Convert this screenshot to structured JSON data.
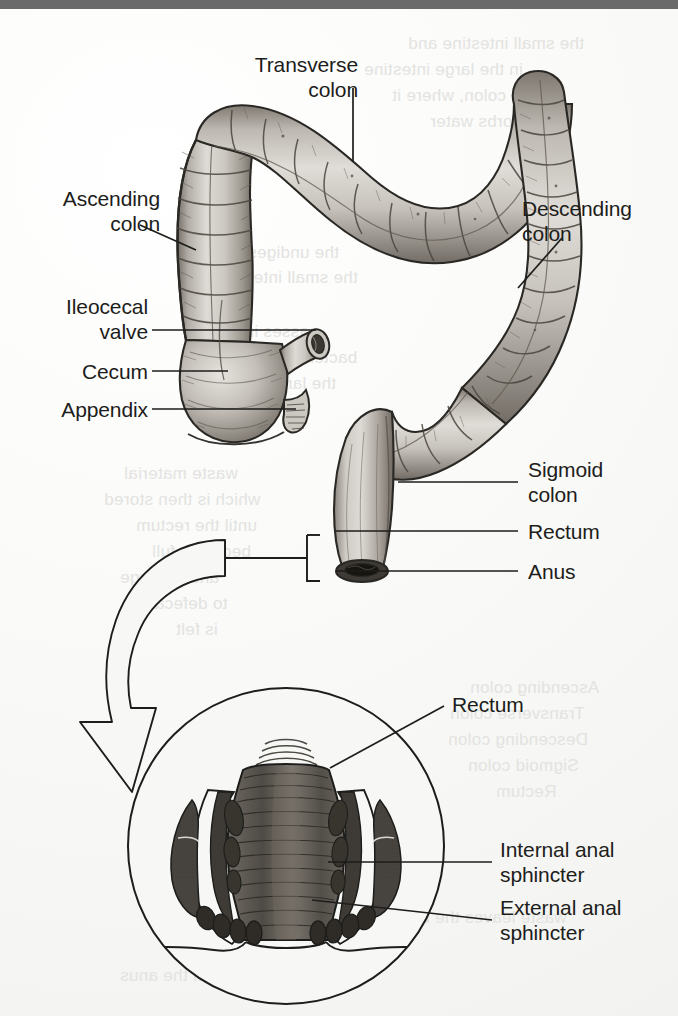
{
  "figure": {
    "style": "grayscale pen-and-ink medical illustration on book page"
  },
  "colors": {
    "page_background": "#f4f4f2",
    "top_bar": "#6a6a6a",
    "ink": "#1d1d1b",
    "tissue_light": "#d8d5d0",
    "tissue_mid": "#a9a49d",
    "tissue_dark": "#6e6a64",
    "muscle_dark": "#4a4743",
    "showthrough_text": "#e3e3e1"
  },
  "main_diagram": {
    "labels": [
      {
        "id": "transverse-colon",
        "text": "Transverse\ncolon",
        "align": "center"
      },
      {
        "id": "ascending-colon",
        "text": "Ascending\ncolon",
        "align": "right"
      },
      {
        "id": "descending-colon",
        "text": "Descending\ncolon",
        "align": "left"
      },
      {
        "id": "ileocecal-valve",
        "text": "Ileocecal\nvalve",
        "align": "right"
      },
      {
        "id": "cecum",
        "text": "Cecum",
        "align": "right"
      },
      {
        "id": "appendix",
        "text": "Appendix",
        "align": "right"
      },
      {
        "id": "sigmoid-colon",
        "text": "Sigmoid\ncolon",
        "align": "left"
      },
      {
        "id": "rectum",
        "text": "Rectum",
        "align": "left"
      },
      {
        "id": "anus",
        "text": "Anus",
        "align": "left"
      }
    ]
  },
  "inset_diagram": {
    "title": "Anal canal cross-section",
    "labels": [
      {
        "id": "inset-rectum",
        "text": "Rectum",
        "align": "left"
      },
      {
        "id": "internal-anal-sphincter",
        "text": "Internal anal\nsphincter",
        "align": "left"
      },
      {
        "id": "external-anal-sphincter",
        "text": "External anal\nsphincter",
        "align": "left"
      }
    ]
  },
  "showthrough_lines": [
    {
      "text": "the small intestine and",
      "x": 408,
      "y": 34
    },
    {
      "text": "in the large intestine",
      "x": 364,
      "y": 60
    },
    {
      "text": "the colon, where it",
      "x": 392,
      "y": 86
    },
    {
      "text": "absorbs water",
      "x": 430,
      "y": 112
    },
    {
      "text": "the undigested food",
      "x": 184,
      "y": 243
    },
    {
      "text": "the small intestine",
      "x": 216,
      "y": 268
    },
    {
      "text": "passes into the",
      "x": 200,
      "y": 322
    },
    {
      "text": "bacterial action",
      "x": 238,
      "y": 348
    },
    {
      "text": "the large intestine",
      "x": 196,
      "y": 374
    },
    {
      "text": "waste material",
      "x": 124,
      "y": 464
    },
    {
      "text": "which is then stored",
      "x": 104,
      "y": 490
    },
    {
      "text": "until the rectum",
      "x": 136,
      "y": 516
    },
    {
      "text": "becomes full",
      "x": 152,
      "y": 542
    },
    {
      "text": "and the urge",
      "x": 120,
      "y": 568
    },
    {
      "text": "to defecate",
      "x": 140,
      "y": 594
    },
    {
      "text": "is felt",
      "x": 176,
      "y": 620
    },
    {
      "text": "Ascending colon",
      "x": 470,
      "y": 678
    },
    {
      "text": "Transverse colon",
      "x": 450,
      "y": 704
    },
    {
      "text": "Descending colon",
      "x": 448,
      "y": 730
    },
    {
      "text": "Sigmoid colon",
      "x": 468,
      "y": 756
    },
    {
      "text": "Rectum",
      "x": 496,
      "y": 782
    },
    {
      "text": "waste leaves the body",
      "x": 392,
      "y": 908
    },
    {
      "text": "through the anus",
      "x": 120,
      "y": 966
    }
  ]
}
